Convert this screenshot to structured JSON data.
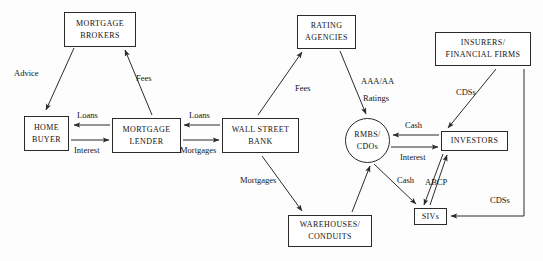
{
  "diagram": {
    "nodes": [
      {
        "id": "mortgage-brokers",
        "shape": "box",
        "lines": [
          "MORTGAGE",
          "BROKERS"
        ],
        "x": 64,
        "y": 12,
        "w": 72,
        "h": 35
      },
      {
        "id": "home-buyer",
        "shape": "box",
        "lines": [
          "HOME",
          "BUYER"
        ],
        "x": 24,
        "y": 116,
        "w": 45,
        "h": 35
      },
      {
        "id": "mortgage-lender",
        "shape": "box",
        "lines": [
          "MORTGAGE",
          "LENDER"
        ],
        "x": 112,
        "y": 118,
        "w": 69,
        "h": 35
      },
      {
        "id": "wall-street-bank",
        "shape": "box",
        "lines": [
          "WALL STREET",
          "BANK"
        ],
        "x": 222,
        "y": 118,
        "w": 77,
        "h": 35
      },
      {
        "id": "rating-agencies",
        "shape": "box",
        "lines": [
          "RATING",
          "AGENCIES"
        ],
        "x": 297,
        "y": 15,
        "w": 59,
        "h": 34
      },
      {
        "id": "insurers",
        "shape": "box",
        "lines": [
          "INSURERS/",
          "FINANCIAL FIRMS"
        ],
        "x": 435,
        "y": 32,
        "w": 96,
        "h": 34
      },
      {
        "id": "rmbs-cdos",
        "shape": "circle",
        "lines": [
          "RMBS/",
          "CDOs"
        ],
        "x": 345,
        "y": 118,
        "w": 45,
        "h": 45
      },
      {
        "id": "investors",
        "shape": "box",
        "lines": [
          "INVESTORS"
        ],
        "x": 441,
        "y": 131,
        "w": 67,
        "h": 20
      },
      {
        "id": "warehouses",
        "shape": "box",
        "lines": [
          "WAREHOUSES/",
          "CONDUITS"
        ],
        "x": 288,
        "y": 215,
        "w": 84,
        "h": 32
      },
      {
        "id": "sivs",
        "shape": "box",
        "lines": [
          "SIVs"
        ],
        "x": 414,
        "y": 208,
        "w": 33,
        "h": 17
      }
    ],
    "edge_labels": [
      {
        "id": "advice",
        "text": "Advice",
        "x": 14,
        "y": 68
      },
      {
        "id": "fees-brokers",
        "text": "Fees",
        "x": 136,
        "y": 73
      },
      {
        "id": "loans-to-buyer",
        "text": "Loans",
        "x": 77,
        "y": 110
      },
      {
        "id": "interest",
        "text": "Interest",
        "x": 74,
        "y": 145
      },
      {
        "id": "loans-to-lender",
        "text": "Loans",
        "x": 189,
        "y": 110
      },
      {
        "id": "mortgages-lender",
        "text": "Mortgages",
        "x": 180,
        "y": 145
      },
      {
        "id": "fees-rating",
        "text": "Fees",
        "x": 295,
        "y": 83
      },
      {
        "id": "aaa-aa",
        "text": "AAA/AA",
        "x": 361,
        "y": 76
      },
      {
        "id": "ratings",
        "text": "Ratings",
        "x": 363,
        "y": 93
      },
      {
        "id": "cdss-top",
        "text": "CDSs",
        "x": 456,
        "y": 87
      },
      {
        "id": "cash-investors",
        "text": "Cash",
        "x": 405,
        "y": 120
      },
      {
        "id": "interest-rmbs",
        "text": "Interest",
        "x": 400,
        "y": 152
      },
      {
        "id": "cash-sivs",
        "text": "Cash",
        "x": 397,
        "y": 175
      },
      {
        "id": "abcp",
        "text": "ABCP",
        "x": 425,
        "y": 177
      },
      {
        "id": "cdss-sivs",
        "text": "CDSs",
        "x": 490,
        "y": 195
      },
      {
        "id": "mortgages-wh",
        "text": "Mortgages",
        "x": 240,
        "y": 175
      }
    ],
    "colors": {
      "stroke": "#2b2b2b",
      "text": "#111111",
      "background": "#fdfdfd"
    }
  }
}
